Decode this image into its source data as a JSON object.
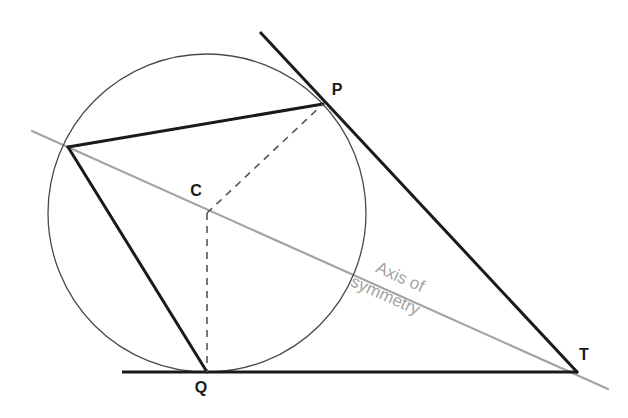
{
  "figure": {
    "kind": "geometry-diagram",
    "background_color": "#ffffff",
    "width": 628,
    "height": 418
  },
  "colors": {
    "stroke_dark": "#1a1a1a",
    "stroke_thin": "#4a4a4a",
    "stroke_dashed": "#555555",
    "axis_gray": "#a3a3a3",
    "label_dark": "#1a1a1a",
    "background": "#ffffff"
  },
  "labels": {
    "P": "P",
    "C": "C",
    "Q": "Q",
    "T": "T",
    "axis_line_1": "Axis of",
    "axis_line_2": "symmetry"
  },
  "geometry": {
    "circle": {
      "cx": 207,
      "cy": 213,
      "r": 159
    },
    "points": {
      "P": {
        "x": 323,
        "y": 104
      },
      "C": {
        "x": 207,
        "y": 213
      },
      "Q": {
        "x": 207,
        "y": 372
      },
      "T": {
        "x": 573,
        "y": 371
      },
      "R": {
        "x": 68,
        "y": 147
      }
    },
    "label_positions": {
      "P": {
        "x": 337,
        "y": 95
      },
      "C": {
        "x": 196,
        "y": 196
      },
      "Q": {
        "x": 201,
        "y": 393
      },
      "T": {
        "x": 584,
        "y": 360
      }
    },
    "segments": {
      "tangent_through_P": {
        "x1": 260,
        "y1": 32,
        "x2": 578,
        "y2": 373
      },
      "tangent_through_Q": {
        "x1": 122,
        "y1": 372,
        "x2": 578,
        "y2": 372
      },
      "chord_R_to_P": {
        "x1": 68,
        "y1": 147,
        "x2": 323,
        "y2": 104
      },
      "chord_R_to_Q": {
        "x1": 68,
        "y1": 147,
        "x2": 207,
        "y2": 372
      },
      "radius_C_to_P_dashed": {
        "x1": 207,
        "y1": 213,
        "x2": 323,
        "y2": 104
      },
      "radius_C_to_Q_dashed": {
        "x1": 207,
        "y1": 213,
        "x2": 207,
        "y2": 372
      },
      "axis_of_symmetry": {
        "x1": 32,
        "y1": 131,
        "x2": 608,
        "y2": 389
      }
    },
    "axis_label_anchor": {
      "x": 398,
      "y": 282,
      "rotation_deg": 24
    },
    "dash_pattern": "7 6"
  }
}
